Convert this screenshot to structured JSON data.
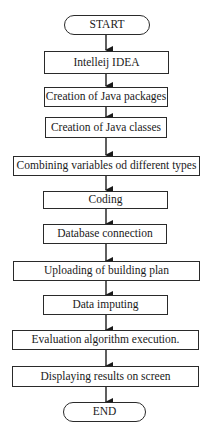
{
  "flowchart": {
    "start": {
      "label": "START"
    },
    "steps": [
      {
        "label": "Intelleij IDEA"
      },
      {
        "label": "Creation of Java packages"
      },
      {
        "label": "Creation of Java classes"
      },
      {
        "label": "Combining variables od different types"
      },
      {
        "label": "Coding"
      },
      {
        "label": "Database connection"
      },
      {
        "label": "Uploading of building plan"
      },
      {
        "label": "Data imputing"
      },
      {
        "label": "Evaluation algorithm execution."
      },
      {
        "label": "Displaying results on screen"
      }
    ],
    "end": {
      "label": "END"
    },
    "colors": {
      "line": "#1a1a1a",
      "box_fill": "#ffffff",
      "background": "#ffffff"
    }
  }
}
